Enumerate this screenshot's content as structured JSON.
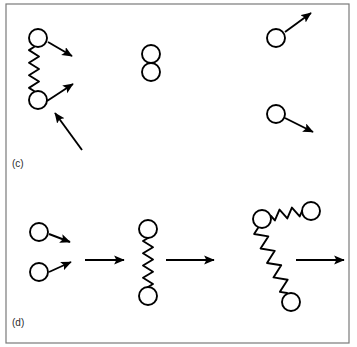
{
  "figure": {
    "width": 357,
    "height": 347,
    "background_color": "#ffffff",
    "stroke_color": "#000000",
    "border_color": "#7a7a7a",
    "label_color": "#2b2b2b",
    "border": {
      "x": 6,
      "y": 4,
      "width": 343,
      "height": 339
    }
  },
  "panels": [
    {
      "id": "panel-c",
      "label": "(c)",
      "label_x": 12,
      "label_y": 167,
      "description": "Two bead-spring dimers and free beads with velocity arrows",
      "circles": [
        {
          "name": "bead-c-top-left",
          "cx": 38,
          "cy": 38,
          "r": 9
        },
        {
          "name": "bead-c-bottom-left",
          "cx": 38,
          "cy": 100,
          "r": 9
        },
        {
          "name": "bead-c-mid-upper",
          "cx": 151,
          "cy": 54,
          "r": 9
        },
        {
          "name": "bead-c-mid-lower",
          "cx": 151,
          "cy": 72,
          "r": 9
        },
        {
          "name": "bead-c-right-upper",
          "cx": 276,
          "cy": 38,
          "r": 9
        },
        {
          "name": "bead-c-right-lower",
          "cx": 276,
          "cy": 114,
          "r": 9
        }
      ],
      "springs": [
        {
          "name": "spring-c-left",
          "x1": 34,
          "y1": 47,
          "x2": 34,
          "y2": 91,
          "amplitude": 5,
          "zigs": 7
        }
      ],
      "arrows": [
        {
          "name": "arrow-c-top-left-bead",
          "x1": 48,
          "y1": 42,
          "x2": 72,
          "y2": 56
        },
        {
          "name": "arrow-c-bottom-left-bead",
          "x1": 47,
          "y1": 101,
          "x2": 73,
          "y2": 84
        },
        {
          "name": "arrow-c-incoming",
          "x1": 82,
          "y1": 150,
          "x2": 55,
          "y2": 113
        },
        {
          "name": "arrow-c-right-upper",
          "x1": 285,
          "y1": 32,
          "x2": 311,
          "y2": 13
        },
        {
          "name": "arrow-c-right-lower",
          "x1": 285,
          "y1": 118,
          "x2": 313,
          "y2": 132
        }
      ]
    },
    {
      "id": "panel-d",
      "label": "(d)",
      "label_x": 12,
      "label_y": 326,
      "description": "Reaction sequence: two free beads combine into a dimer, then into a trimer",
      "circles": [
        {
          "name": "bead-d-reactant-upper",
          "cx": 39,
          "cy": 232,
          "r": 9
        },
        {
          "name": "bead-d-reactant-lower",
          "cx": 39,
          "cy": 272,
          "r": 9
        },
        {
          "name": "bead-d-dimer-top",
          "cx": 148,
          "cy": 229,
          "r": 9
        },
        {
          "name": "bead-d-dimer-bottom",
          "cx": 148,
          "cy": 296,
          "r": 9
        },
        {
          "name": "bead-d-trimer-left",
          "cx": 262,
          "cy": 219,
          "r": 9
        },
        {
          "name": "bead-d-trimer-right",
          "cx": 311,
          "cy": 211,
          "r": 9
        },
        {
          "name": "bead-d-trimer-bottom",
          "cx": 291,
          "cy": 302,
          "r": 9
        }
      ],
      "springs": [
        {
          "name": "spring-d-dimer",
          "x1": 148,
          "y1": 238,
          "x2": 148,
          "y2": 287,
          "amplitude": 5,
          "zigs": 8
        },
        {
          "name": "spring-d-trimer-top",
          "x1": 271,
          "y1": 216,
          "x2": 302,
          "y2": 211,
          "amplitude": 5,
          "zigs": 5
        },
        {
          "name": "spring-d-trimer-diagonal",
          "x1": 258,
          "y1": 228,
          "x2": 287,
          "y2": 293,
          "amplitude": 6,
          "zigs": 9
        }
      ],
      "arrows": [
        {
          "name": "arrow-d-reactant-upper",
          "x1": 49,
          "y1": 234,
          "x2": 70,
          "y2": 242
        },
        {
          "name": "arrow-d-reactant-lower",
          "x1": 49,
          "y1": 272,
          "x2": 71,
          "y2": 262
        },
        {
          "name": "arrow-d-reaction-step-1",
          "x1": 85,
          "y1": 260,
          "x2": 124,
          "y2": 260
        },
        {
          "name": "arrow-d-reaction-step-2",
          "x1": 166,
          "y1": 260,
          "x2": 214,
          "y2": 260
        },
        {
          "name": "arrow-d-reaction-step-3",
          "x1": 296,
          "y1": 260,
          "x2": 344,
          "y2": 260
        }
      ]
    }
  ]
}
